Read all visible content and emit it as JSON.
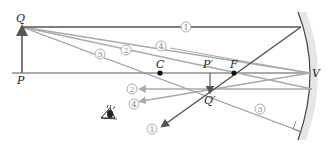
{
  "diagram": {
    "points": {
      "Q": "Q",
      "P": "P",
      "C": "C",
      "F": "F",
      "P_prime": "P′",
      "Q_prime": "Q′",
      "V": "V"
    },
    "ray_labels": {
      "ray1_in": "1",
      "ray1_out": "1",
      "ray2_in": "2",
      "ray2_out": "2",
      "ray3_in": "3",
      "ray3_out": "3",
      "ray4_in": "4",
      "ray4_out": "4"
    },
    "colors": {
      "ray_dark": "#555555",
      "ray_light": "#aaaaaa",
      "mirror_shade": "#e6e6e6",
      "label": "#222222"
    }
  }
}
